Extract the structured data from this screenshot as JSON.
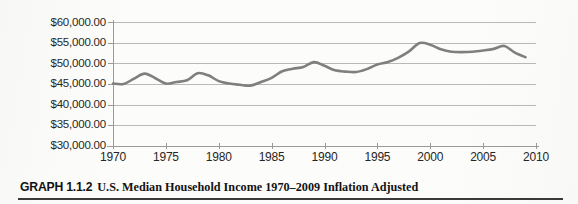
{
  "caption": {
    "label": "GRAPH 1.1.2",
    "text": "U.S. Median Household Income 1970–2009 Inflation Adjusted"
  },
  "colors": {
    "series_line": "#7f7f7f",
    "gridline": "#b9b9b9",
    "axis": "#9a9a9a",
    "text": "#262626",
    "background": "#fcfcfa",
    "caption_rule": "#3a3a3a"
  },
  "chart_data": {
    "type": "line",
    "title": "U.S. Median Household Income 1970–2009 Inflation Adjusted",
    "xlabel": "",
    "ylabel": "",
    "xlim": [
      1970,
      2010
    ],
    "ylim": [
      30000,
      60000
    ],
    "grid": true,
    "legend": "none",
    "y_ticks": [
      30000,
      35000,
      40000,
      45000,
      50000,
      55000,
      60000
    ],
    "y_tick_labels": [
      "$30,000.00",
      "$35,000.00",
      "$40,000.00",
      "$45,000.00",
      "$50,000.00",
      "$55,000.00",
      "$60,000.00"
    ],
    "x_ticks": [
      1970,
      1975,
      1980,
      1985,
      1990,
      1995,
      2000,
      2005,
      2010
    ],
    "x_tick_labels": [
      "1970",
      "1975",
      "1980",
      "1985",
      "1990",
      "1995",
      "2000",
      "2005",
      "2010"
    ],
    "series": [
      {
        "name": "U.S. Median Household Income (Inflation Adjusted)",
        "x": [
          1970,
          1971,
          1972,
          1973,
          1974,
          1975,
          1976,
          1977,
          1978,
          1979,
          1980,
          1981,
          1982,
          1983,
          1984,
          1985,
          1986,
          1987,
          1988,
          1989,
          1990,
          1991,
          1992,
          1993,
          1994,
          1995,
          1996,
          1997,
          1998,
          1999,
          2000,
          2001,
          2002,
          2003,
          2004,
          2005,
          2006,
          2007,
          2008,
          2009
        ],
        "values": [
          45100,
          45000,
          46300,
          47500,
          46400,
          45100,
          45500,
          45900,
          47600,
          47100,
          45700,
          45100,
          44800,
          44600,
          45500,
          46500,
          48100,
          48700,
          49100,
          50300,
          49400,
          48300,
          48000,
          47900,
          48600,
          49700,
          50300,
          51400,
          52900,
          54900,
          54500,
          53400,
          52800,
          52700,
          52800,
          53100,
          53500,
          54200,
          52600,
          51500
        ]
      }
    ],
    "annotations": []
  }
}
